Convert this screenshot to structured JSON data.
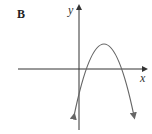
{
  "figure": {
    "label": "B",
    "x_axis_label": "x",
    "y_axis_label": "y",
    "curve": "downward-opening parabola",
    "colors": {
      "axis": "#333333",
      "curve": "#555555"
    }
  }
}
